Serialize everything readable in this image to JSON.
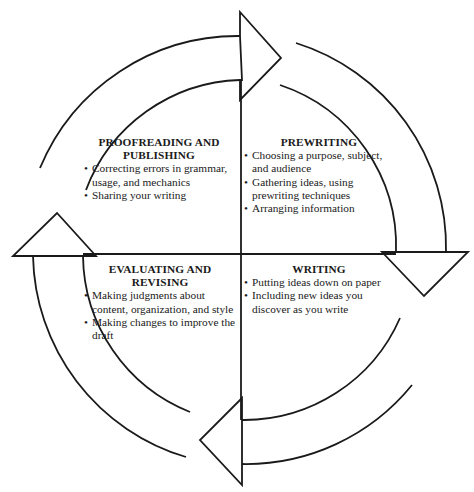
{
  "diagram": {
    "type": "cyclical-process",
    "direction": "clockwise",
    "stroke_color": "#1a1a1a",
    "background_color": "#ffffff",
    "quadrants": [
      {
        "id": "prewriting",
        "position": "top-right",
        "title": "PREWRITING",
        "items": [
          "Choosing a purpose, subject, and audience",
          "Gathering ideas, using prewriting techniques",
          "Arranging information"
        ]
      },
      {
        "id": "writing",
        "position": "bottom-right",
        "title": "WRITING",
        "items": [
          "Putting ideas down on paper",
          "Including new ideas you discover as you write"
        ]
      },
      {
        "id": "evaluating",
        "position": "bottom-left",
        "title": "EVALUATING AND REVISING",
        "items": [
          "Making judgments about content, organization, and style",
          "Making changes to improve the draft"
        ]
      },
      {
        "id": "proofreading",
        "position": "top-left",
        "title": "PROOFREADING AND PUBLISHING",
        "items": [
          "Correcting errors in grammar, usage, and mechanics",
          "Sharing your writing"
        ]
      }
    ],
    "arrows": [
      {
        "position": "top",
        "points": "right"
      },
      {
        "position": "right",
        "points": "down"
      },
      {
        "position": "bottom",
        "points": "left"
      },
      {
        "position": "left",
        "points": "up"
      }
    ]
  }
}
